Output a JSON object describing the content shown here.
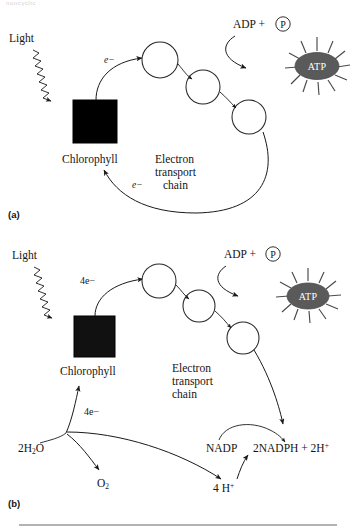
{
  "figure": {
    "top_fragment": "noncyclic",
    "background_color": "#ffffff",
    "footer_rule_color": "#9a9a9a"
  },
  "panels": [
    {
      "tag": "(a)",
      "name": "cyclic-photophosphorylation",
      "light_label": "Light",
      "chlorophyll_label": "Chlorophyll",
      "electron_label_in": "e−",
      "electron_label_return": "e−",
      "etc_label_line1": "Electron",
      "etc_label_line2": "transport",
      "etc_label_line3": "chain",
      "adp_label": "ADP +",
      "phosphate_label": "P",
      "atp_label": "ATP",
      "atp_color": "#5a5a5a",
      "chlorophyll_color": "#000000",
      "carrier_count": 3
    },
    {
      "tag": "(b)",
      "name": "noncyclic-photophosphorylation",
      "light_label": "Light",
      "chlorophyll_label": "Chlorophyll",
      "electron_label_in": "4e−",
      "electron_label_water": "4e−",
      "etc_label_line1": "Electron",
      "etc_label_line2": "transport",
      "etc_label_line3": "chain",
      "adp_label": "ADP +",
      "phosphate_label": "P",
      "atp_label": "ATP",
      "atp_color": "#5a5a5a",
      "chlorophyll_color": "#111111",
      "carrier_count": 3,
      "water_label": "2H",
      "water_sub": "2",
      "water_tail": "O",
      "oxygen_label": "O",
      "oxygen_sub": "2",
      "nadp_label": "NADP",
      "nadph_label": "2NADPH + 2H",
      "nadph_sup": "+",
      "proton_label": "4 H",
      "proton_sup": "+"
    }
  ]
}
